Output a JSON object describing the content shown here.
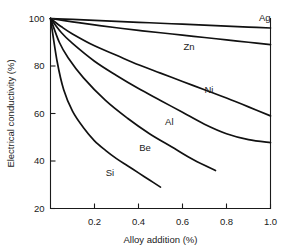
{
  "chart_data": {
    "type": "line",
    "title": "",
    "xlabel": "Alloy addition (%)",
    "ylabel": "Electrical conductivity (%)",
    "xlim": [
      0,
      1.0
    ],
    "ylim": [
      20,
      100
    ],
    "xticks": [
      "0.2",
      "0.4",
      "0.6",
      "0.8",
      "1.0"
    ],
    "xtick_values": [
      0.2,
      0.4,
      0.6,
      0.8,
      1.0
    ],
    "yticks": [
      "20",
      "40",
      "60",
      "80",
      "100"
    ],
    "ytick_values": [
      20,
      40,
      60,
      80,
      100
    ],
    "grid": false,
    "legend_position": "inline-labels",
    "series": [
      {
        "name": "Ag",
        "label": "Ag",
        "label_x": 1.0,
        "label_y": 100.5,
        "x": [
          0.0,
          0.1,
          0.2,
          0.3,
          0.4,
          0.5,
          0.6,
          0.7,
          0.8,
          0.9,
          1.0
        ],
        "values": [
          100,
          99.6,
          99.2,
          98.8,
          98.4,
          98.0,
          97.6,
          97.2,
          96.8,
          96.4,
          96.0
        ]
      },
      {
        "name": "Zn",
        "label": "Zn",
        "label_x": 0.63,
        "label_y": 88.0,
        "x": [
          0.0,
          0.1,
          0.2,
          0.3,
          0.4,
          0.5,
          0.6,
          0.7,
          0.8,
          0.9,
          1.0
        ],
        "values": [
          100,
          98.6,
          97.3,
          96.1,
          95.0,
          94.0,
          93.0,
          92.0,
          91.0,
          90.0,
          89.0
        ]
      },
      {
        "name": "Ni",
        "label": "Ni",
        "label_x": 0.72,
        "label_y": 70.0,
        "x": [
          0.0,
          0.05,
          0.1,
          0.2,
          0.3,
          0.4,
          0.5,
          0.6,
          0.7,
          0.8,
          0.9,
          1.0
        ],
        "values": [
          100,
          96.5,
          93.5,
          88.5,
          84.5,
          80.5,
          77.0,
          73.5,
          70.0,
          66.5,
          62.8,
          59.0
        ]
      },
      {
        "name": "Al",
        "label": "Al",
        "label_x": 0.54,
        "label_y": 56.5,
        "x": [
          0.0,
          0.05,
          0.1,
          0.2,
          0.3,
          0.4,
          0.5,
          0.6,
          0.7,
          0.8,
          0.9,
          1.0
        ],
        "values": [
          100,
          94.0,
          89.5,
          82.0,
          76.0,
          70.5,
          65.5,
          60.5,
          55.5,
          51.5,
          49.0,
          47.7
        ]
      },
      {
        "name": "Be",
        "label": "Be",
        "label_x": 0.43,
        "label_y": 45.5,
        "x": [
          0.0,
          0.04,
          0.08,
          0.15,
          0.25,
          0.35,
          0.45,
          0.55,
          0.65,
          0.75
        ],
        "values": [
          100,
          90.0,
          83.5,
          75.0,
          65.5,
          58.0,
          51.5,
          46.0,
          40.5,
          36.0
        ]
      },
      {
        "name": "Si",
        "label": "Si",
        "label_x": 0.27,
        "label_y": 35.0,
        "x": [
          0.0,
          0.03,
          0.06,
          0.1,
          0.15,
          0.2,
          0.25,
          0.3,
          0.35,
          0.4,
          0.45,
          0.5
        ],
        "values": [
          100,
          82.0,
          70.0,
          61.0,
          54.0,
          48.5,
          44.5,
          41.0,
          38.0,
          35.0,
          32.0,
          29.0
        ]
      }
    ]
  },
  "colors": {
    "curve": "#111111",
    "axis": "#1a1a1a",
    "background": "#ffffff"
  }
}
